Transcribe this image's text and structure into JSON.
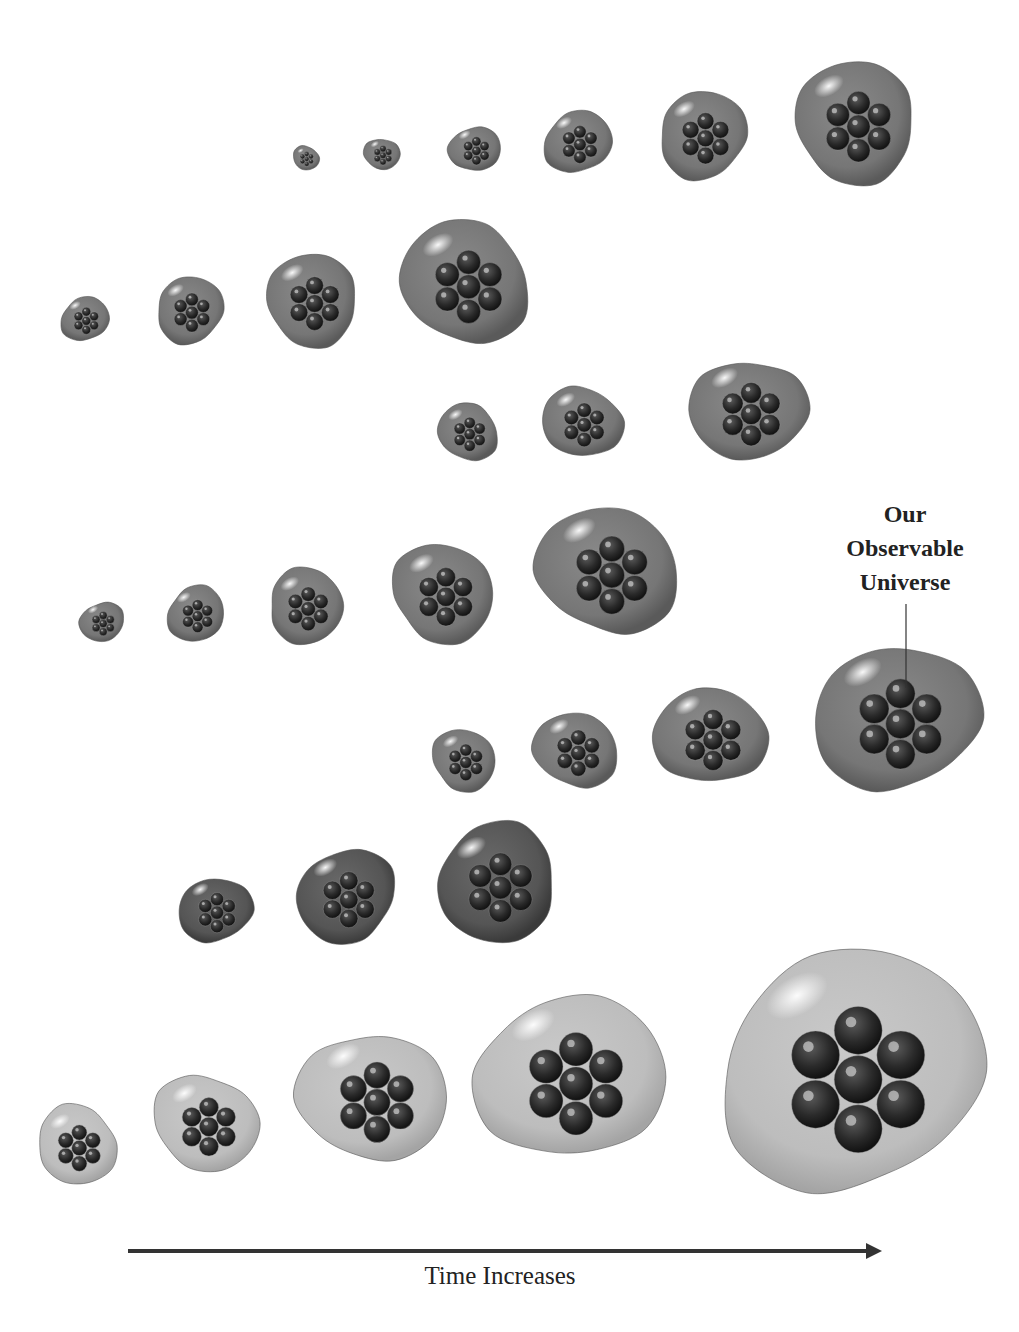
{
  "figure": {
    "callout_label": "Our Observable Universe",
    "callout_lines": [
      "Our",
      "Observable",
      "Universe"
    ],
    "axis_label": "Time Increases",
    "colors": {
      "background": "#ffffff",
      "bubble_outer_dark": "#6f6f6f",
      "bubble_outer_light": "#bdbdbd",
      "bubble_inner": "#2a2a2a",
      "arrow": "#333333"
    }
  },
  "rows": [
    {
      "id": "row-1",
      "shade": "mid",
      "bubbles": [
        {
          "cx": 306,
          "cy": 158,
          "r": 12
        },
        {
          "cx": 382,
          "cy": 154,
          "r": 16
        },
        {
          "cx": 475,
          "cy": 149,
          "r": 23
        },
        {
          "cx": 578,
          "cy": 142,
          "r": 31
        },
        {
          "cx": 703,
          "cy": 135,
          "r": 42
        },
        {
          "cx": 855,
          "cy": 122,
          "r": 58
        }
      ]
    },
    {
      "id": "row-2",
      "shade": "mid",
      "bubbles": [
        {
          "cx": 85,
          "cy": 319,
          "r": 22
        },
        {
          "cx": 190,
          "cy": 310,
          "r": 32
        },
        {
          "cx": 312,
          "cy": 300,
          "r": 44
        },
        {
          "cx": 465,
          "cy": 282,
          "r": 60
        }
      ]
    },
    {
      "id": "row-3",
      "shade": "mid",
      "bubbles": [
        {
          "cx": 468,
          "cy": 432,
          "r": 28
        },
        {
          "cx": 582,
          "cy": 422,
          "r": 36
        },
        {
          "cx": 748,
          "cy": 410,
          "r": 52
        }
      ]
    },
    {
      "id": "row-4",
      "shade": "mid",
      "bubbles": [
        {
          "cx": 102,
          "cy": 622,
          "r": 20
        },
        {
          "cx": 196,
          "cy": 614,
          "r": 27
        },
        {
          "cx": 306,
          "cy": 606,
          "r": 36
        },
        {
          "cx": 443,
          "cy": 593,
          "r": 48
        },
        {
          "cx": 608,
          "cy": 570,
          "r": 64
        }
      ]
    },
    {
      "id": "row-5",
      "shade": "mid",
      "bubbles": [
        {
          "cx": 464,
          "cy": 760,
          "r": 30
        },
        {
          "cx": 576,
          "cy": 750,
          "r": 38
        },
        {
          "cx": 710,
          "cy": 736,
          "r": 50
        },
        {
          "cx": 896,
          "cy": 718,
          "r": 74,
          "highlight": true
        }
      ]
    },
    {
      "id": "row-6",
      "shade": "dark",
      "bubbles": [
        {
          "cx": 215,
          "cy": 910,
          "r": 33
        },
        {
          "cx": 346,
          "cy": 896,
          "r": 46
        },
        {
          "cx": 497,
          "cy": 883,
          "r": 57
        }
      ]
    },
    {
      "id": "row-7",
      "shade": "light",
      "bubbles": [
        {
          "cx": 77,
          "cy": 1145,
          "r": 38
        },
        {
          "cx": 206,
          "cy": 1123,
          "r": 48
        },
        {
          "cx": 373,
          "cy": 1097,
          "r": 66
        },
        {
          "cx": 571,
          "cy": 1077,
          "r": 84
        },
        {
          "cx": 851,
          "cy": 1070,
          "r": 120
        }
      ]
    }
  ],
  "arrow": {
    "x1": 128,
    "y1": 1251,
    "x2": 882,
    "y2": 1251
  }
}
